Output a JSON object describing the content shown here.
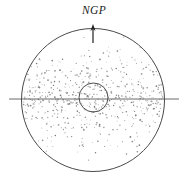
{
  "figure": {
    "background_color": "#ffffff",
    "stroke_color": "#4a4a4a",
    "dot_color": "#8a8a8a",
    "label_color": "#1b1b1b",
    "width": 188,
    "height": 186
  },
  "labels": {
    "north_galactic_pole": "NGP"
  },
  "elements": {
    "outer_circle": {
      "name": "halo-boundary",
      "cx": 93,
      "cy": 100,
      "r": 71.5,
      "stroke_width": 1.0
    },
    "inner_circle": {
      "name": "nuclear-bulge",
      "cx": 93.5,
      "cy": 97.5,
      "r": 14.5,
      "stroke_width": 1.0
    },
    "midplane_line": {
      "name": "galactic-plane",
      "x1": 9,
      "x2": 179,
      "y": 99,
      "stroke_width": 1.0
    },
    "pole_arrow": {
      "name": "ngp-arrow",
      "x": 93,
      "y_tail": 43,
      "y_head": 25,
      "head_width": 5,
      "head_length": 7,
      "stroke_width": 1.2
    }
  },
  "chart_data": {
    "type": "scatter",
    "xlabel": "",
    "ylabel": "",
    "xlim": [
      -1.05,
      1.05
    ],
    "ylim": [
      -1.05,
      1.05
    ],
    "grid": false,
    "legend": null,
    "annotations": [
      {
        "text": "NGP",
        "x": 0.0,
        "y": 1.22,
        "style": "italic"
      }
    ],
    "series": [
      {
        "name": "halo-objects",
        "marker": "dot",
        "color": "#8a8a8a",
        "count": 620,
        "distribution": "uniform-in-disk, density falling off exponentially with |z| from the galactic midplane",
        "scale_height": 0.28
      }
    ]
  }
}
